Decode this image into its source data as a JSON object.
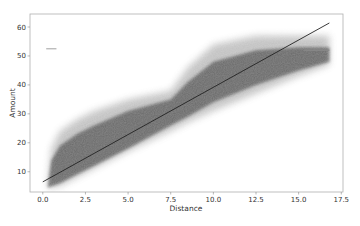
{
  "chart_data": {
    "type": "scatter",
    "title": "",
    "xlabel": "Distance",
    "ylabel": "Amount",
    "xlim": [
      -0.75,
      17.6
    ],
    "ylim": [
      3.0,
      64.5
    ],
    "xticks": [
      0.0,
      2.5,
      5.0,
      7.5,
      10.0,
      12.5,
      15.0,
      17.5
    ],
    "xtick_labels": [
      "0.0",
      "2.5",
      "5.0",
      "7.5",
      "10.0",
      "12.5",
      "15.0",
      "17.5"
    ],
    "yticks": [
      10,
      20,
      30,
      40,
      50,
      60
    ],
    "ytick_labels": [
      "10",
      "20",
      "30",
      "40",
      "50",
      "60"
    ],
    "grid": false,
    "legend": null,
    "series": [
      {
        "name": "observations",
        "kind": "dense-scatter-cloud",
        "color": "#555555",
        "envelope": {
          "x": [
            0.3,
            0.5,
            1.0,
            2.0,
            3.0,
            5.0,
            7.5,
            8.5,
            10.0,
            12.5,
            15.0,
            16.8
          ],
          "upper": [
            6,
            18,
            24,
            28,
            31,
            35,
            38,
            46,
            54,
            57,
            57,
            57
          ],
          "lower": [
            4.5,
            4.5,
            5,
            8,
            11,
            17,
            24,
            27,
            31,
            37,
            43,
            47
          ],
          "core_upper": [
            5,
            14,
            19,
            23,
            26,
            31,
            35,
            41,
            48,
            52,
            53,
            53
          ],
          "core_lower": [
            4.5,
            5,
            6,
            9,
            12,
            18,
            26,
            29,
            34,
            40,
            45,
            48
          ]
        }
      },
      {
        "name": "fixed-fare band (high)",
        "kind": "horizontal-streak",
        "color": "#888888",
        "x": [
          15.3,
          16.8
        ],
        "y": 52
      },
      {
        "name": "fixed-fare band (low distance)",
        "kind": "horizontal-streak",
        "color": "#bbbbbb",
        "x": [
          0.2,
          0.8
        ],
        "y": 52.5
      },
      {
        "name": "regression line",
        "kind": "line",
        "color": "#222222",
        "x": [
          0.0,
          16.8
        ],
        "y": [
          6.5,
          61.4
        ]
      }
    ]
  }
}
